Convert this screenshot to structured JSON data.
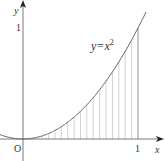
{
  "diagram": {
    "type": "function-graph",
    "function": "y = x^2",
    "curve_label": {
      "base": "y=x",
      "exponent": "2"
    },
    "axes": {
      "x_label": "x",
      "y_label": "y",
      "origin_label": "O",
      "x_tick_label": "1",
      "y_tick_label": "1"
    },
    "shaded_region": {
      "description": "Region under y=x^2 from x=0 to x=1, filled with vertical hatch lines",
      "x_from": 0,
      "x_to": 1,
      "hatch_count": 18
    },
    "colors": {
      "axis": "#555555",
      "curve": "#666666",
      "hatch": "#c8c8c8",
      "text": "#333333",
      "background": "#ffffff"
    }
  }
}
